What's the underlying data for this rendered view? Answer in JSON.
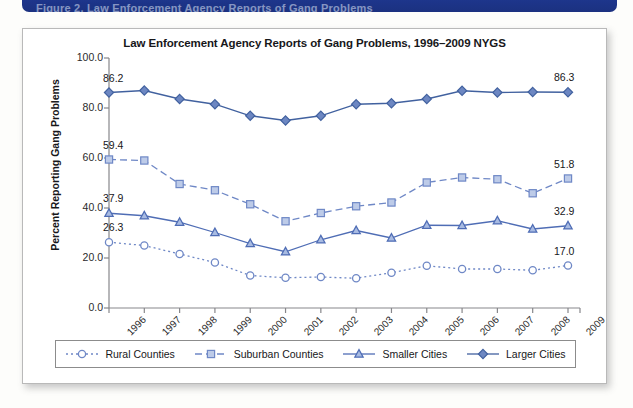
{
  "banner": {
    "text": "Figure 2. Law Enforcement Agency Reports of Gang Problems"
  },
  "card": {
    "title": "Law Enforcement Agency Reports of Gang Problems, 1996–2009 NYGS"
  },
  "chart_data": {
    "type": "line",
    "title": "Law Enforcement Agency Reports of Gang Problems, 1996–2009 NYGS",
    "xlabel": "",
    "ylabel": "Percent Reporting Gang Problems",
    "categories": [
      "1996",
      "1997",
      "1998",
      "1999",
      "2000",
      "2001",
      "2002",
      "2003",
      "2004",
      "2005",
      "2006",
      "2007",
      "2008",
      "2009"
    ],
    "ylim": [
      0.0,
      100.0
    ],
    "yticks": [
      "0.0",
      "20.0",
      "40.0",
      "60.0",
      "80.0",
      "100.0"
    ],
    "ytick_values": [
      0.0,
      20.0,
      40.0,
      60.0,
      80.0,
      100.0
    ],
    "grid": false,
    "legend_position": "bottom",
    "series": [
      {
        "name": "Rural Counties",
        "marker": "circle",
        "linestyle": "dotted",
        "color": "#6f88c6",
        "fill": "#ffffff",
        "values": [
          26.3,
          25.0,
          21.6,
          18.2,
          13.0,
          12.1,
          12.4,
          11.9,
          14.1,
          16.9,
          15.6,
          15.6,
          15.1,
          17.0
        ],
        "endpoint_labels": {
          "first": "26.3",
          "last": "17.0"
        }
      },
      {
        "name": "Suburban Counties",
        "marker": "square",
        "linestyle": "dashed",
        "color": "#6f88c6",
        "fill": "#bdcbe8",
        "values": [
          59.4,
          59.0,
          49.6,
          47.1,
          41.5,
          34.7,
          38.0,
          40.7,
          42.2,
          50.2,
          52.2,
          51.5,
          45.9,
          51.8
        ],
        "endpoint_labels": {
          "first": "59.4",
          "last": "51.8"
        }
      },
      {
        "name": "Smaller Cities",
        "marker": "triangle",
        "linestyle": "solid",
        "color": "#4f6db5",
        "fill": "#a8bbe2",
        "values": [
          37.9,
          36.9,
          34.3,
          30.2,
          25.8,
          22.5,
          27.3,
          31.0,
          28.0,
          33.1,
          33.0,
          34.9,
          31.6,
          32.9
        ],
        "endpoint_labels": {
          "first": "37.9",
          "last": "32.9"
        }
      },
      {
        "name": "Larger Cities",
        "marker": "diamond",
        "linestyle": "solid",
        "color": "#41619f",
        "fill": "#6d87c2",
        "values": [
          86.2,
          87.0,
          83.6,
          81.5,
          76.9,
          75.0,
          76.9,
          81.5,
          81.9,
          83.6,
          86.9,
          86.2,
          86.4,
          86.3
        ],
        "endpoint_labels": {
          "first": "86.2",
          "last": "86.3"
        }
      }
    ]
  },
  "legend": {
    "items": [
      {
        "label": "Rural Counties",
        "key": "circle-dotted-key"
      },
      {
        "label": "Suburban Counties",
        "key": "square-dashed-key"
      },
      {
        "label": "Smaller Cities",
        "key": "triangle-solid-key"
      },
      {
        "label": "Larger Cities",
        "key": "diamond-solid-key"
      }
    ]
  }
}
